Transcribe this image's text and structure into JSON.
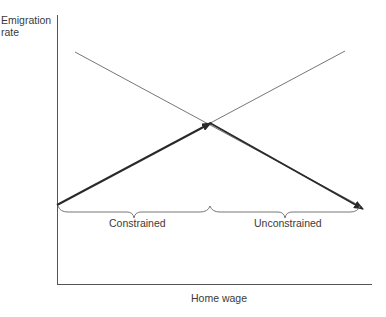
{
  "diagram": {
    "y_axis_label_line1": "Emigration",
    "y_axis_label_line2": "rate",
    "x_axis_label": "Home wage",
    "region_left_label": "Constrained",
    "region_right_label": "Unconstrained",
    "colors": {
      "axis": "#555555",
      "thin_line": "#666666",
      "bold_arrow": "#2a2a2a",
      "brace": "#777777",
      "text": "#3a3a3a"
    }
  }
}
